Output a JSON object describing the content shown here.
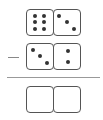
{
  "problem": {
    "operation": "subtraction",
    "operator_symbol": "−",
    "minuend": {
      "left_pips": 6,
      "right_pips": 3
    },
    "subtrahend": {
      "left_pips": 3,
      "right_pips": 2
    },
    "answer": {
      "left_pips": null,
      "right_pips": null,
      "state": "empty"
    }
  },
  "colors": {
    "border": "#555555",
    "pip": "#333333",
    "rule": "#999999"
  }
}
